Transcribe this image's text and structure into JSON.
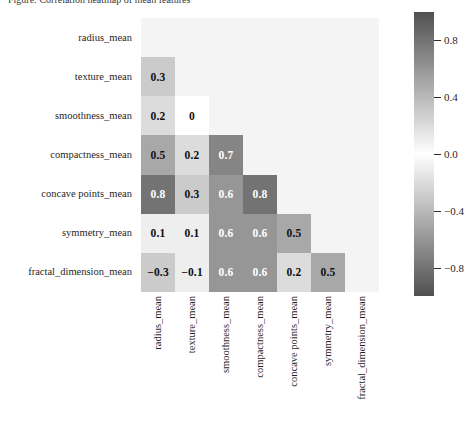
{
  "caption": {
    "text": "Figure: Correlation heatmap of mean features"
  },
  "chart_data": {
    "type": "heatmap",
    "title": "",
    "xlabel": "",
    "ylabel": "",
    "variant": "lower-triangle-correlation-matrix",
    "diagonal_shown": false,
    "grid": false,
    "background_color": "#f4f4f4",
    "colormap": "diverging-grayscale",
    "colorbar": {
      "position": "right",
      "vmin": -1.0,
      "vmax": 1.0,
      "ticks": [
        0.8,
        0.4,
        0.0,
        -0.4,
        -0.8
      ],
      "tick_labels": [
        "0.8",
        "0.4",
        "0.0",
        "-0.4",
        "-0.8"
      ]
    },
    "categories": [
      "radius_mean",
      "texture_mean",
      "smoothness_mean",
      "compactness_mean",
      "concave points_mean",
      "symmetry_mean",
      "fractal_dimension_mean"
    ],
    "row_labels": [
      "radius_mean",
      "texture_mean",
      "smoothness_mean",
      "compactness_mean",
      "concave points_mean",
      "symmetry_mean",
      "fractal_dimension_mean"
    ],
    "col_labels": [
      "radius_mean",
      "texture_mean",
      "smoothness_mean",
      "compactness_mean",
      "concave points_mean",
      "symmetry_mean",
      "fractal_dimension_mean"
    ],
    "cells": [
      {
        "row": 1,
        "col": 0,
        "value": 0.3,
        "label": "0.3"
      },
      {
        "row": 2,
        "col": 0,
        "value": 0.2,
        "label": "0.2"
      },
      {
        "row": 2,
        "col": 1,
        "value": 0.0,
        "label": "0"
      },
      {
        "row": 3,
        "col": 0,
        "value": 0.5,
        "label": "0.5"
      },
      {
        "row": 3,
        "col": 1,
        "value": 0.2,
        "label": "0.2"
      },
      {
        "row": 3,
        "col": 2,
        "value": 0.7,
        "label": "0.7"
      },
      {
        "row": 4,
        "col": 0,
        "value": 0.8,
        "label": "0.8"
      },
      {
        "row": 4,
        "col": 1,
        "value": 0.3,
        "label": "0.3"
      },
      {
        "row": 4,
        "col": 2,
        "value": 0.6,
        "label": "0.6"
      },
      {
        "row": 4,
        "col": 3,
        "value": 0.8,
        "label": "0.8"
      },
      {
        "row": 5,
        "col": 0,
        "value": 0.1,
        "label": "0.1"
      },
      {
        "row": 5,
        "col": 1,
        "value": 0.1,
        "label": "0.1"
      },
      {
        "row": 5,
        "col": 2,
        "value": 0.6,
        "label": "0.6"
      },
      {
        "row": 5,
        "col": 3,
        "value": 0.6,
        "label": "0.6"
      },
      {
        "row": 5,
        "col": 4,
        "value": 0.5,
        "label": "0.5"
      },
      {
        "row": 6,
        "col": 0,
        "value": -0.3,
        "label": "−0.3"
      },
      {
        "row": 6,
        "col": 1,
        "value": -0.1,
        "label": "−0.1"
      },
      {
        "row": 6,
        "col": 2,
        "value": 0.6,
        "label": "0.6"
      },
      {
        "row": 6,
        "col": 3,
        "value": 0.6,
        "label": "0.6"
      },
      {
        "row": 6,
        "col": 4,
        "value": 0.2,
        "label": "0.2"
      },
      {
        "row": 6,
        "col": 5,
        "value": 0.5,
        "label": "0.5"
      }
    ]
  }
}
